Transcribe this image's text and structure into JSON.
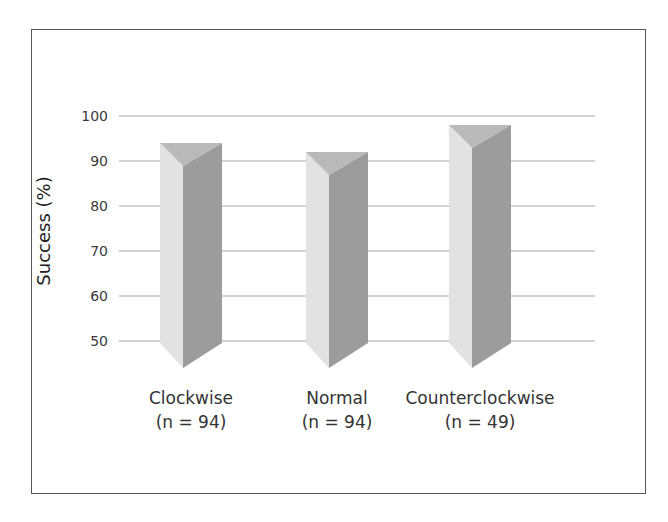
{
  "chart_data": {
    "type": "bar",
    "title": "",
    "xlabel": "",
    "ylabel": "Success (%)",
    "ylim": [
      50,
      100
    ],
    "yticks": [
      50,
      60,
      70,
      80,
      90,
      100
    ],
    "grid": true,
    "categories": [
      "Clockwise",
      "Normal",
      "Counterclockwise"
    ],
    "category_sublabels": [
      "(n = 94)",
      "(n = 94)",
      "(n = 49)"
    ],
    "values": [
      94,
      92,
      98
    ],
    "style": "3d-prism",
    "colors": {
      "left_face": "#e2e2e2",
      "right_face": "#9c9c9c",
      "top_face": "#b9b9b9",
      "grid": "#a8a8a8",
      "frame": "#555555"
    }
  }
}
